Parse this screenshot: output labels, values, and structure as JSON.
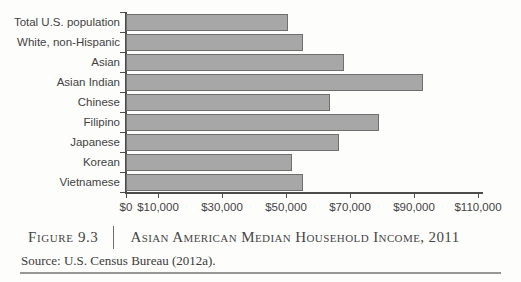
{
  "figure": {
    "label": "Figure 9.3",
    "title": "Asian American Median Household Income, 2011",
    "source": "Source: U.S. Census Bureau (2012a)."
  },
  "chart_data": {
    "type": "bar",
    "orientation": "horizontal",
    "title": "Asian American Median Household Income, 2011",
    "xlabel": "",
    "ylabel": "",
    "grid": false,
    "legend": "none",
    "xlim": [
      0,
      110000
    ],
    "categories": [
      "Total U.S. population",
      "White, non-Hispanic",
      "Asian",
      "Asian Indian",
      "Chinese",
      "Filipino",
      "Japanese",
      "Korean",
      "Vietnamese"
    ],
    "values": [
      50500,
      55200,
      68000,
      92700,
      63700,
      79200,
      66700,
      52000,
      55400
    ],
    "x_ticks": {
      "values": [
        0,
        10000,
        30000,
        50000,
        70000,
        90000,
        110000
      ],
      "labels": [
        "$0",
        "$10,000",
        "$30,000",
        "$50,000",
        "$70,000",
        "$90,000",
        "$110,000"
      ]
    },
    "colors": {
      "bar_fill": "#a7a7a7",
      "bar_border": "#6f6f6f",
      "axis": "#4c4c4c",
      "text": "#424242"
    }
  }
}
